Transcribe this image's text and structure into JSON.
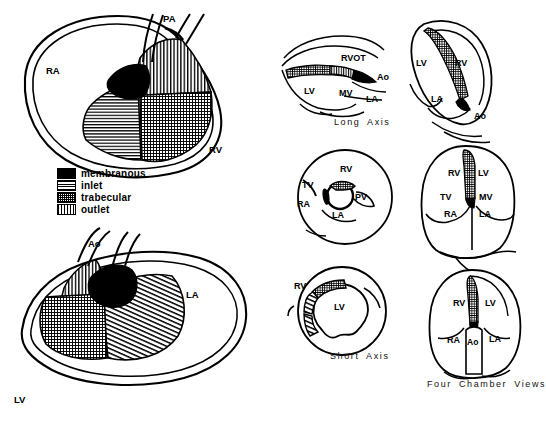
{
  "figure": {
    "stroke_color": "#000000",
    "background_color": "#ffffff"
  },
  "legend": {
    "items": [
      {
        "label": "membranous",
        "pattern": "solid-black",
        "swatch_class": "sw-mem"
      },
      {
        "label": "inlet",
        "pattern": "horizontal-lines",
        "swatch_class": "sw-inlet"
      },
      {
        "label": "trabecular",
        "pattern": "stipple-grid",
        "swatch_class": "sw-trab"
      },
      {
        "label": "outlet",
        "pattern": "vertical-lines",
        "swatch_class": "sw-outlet"
      }
    ]
  },
  "panels": {
    "right_ventricle_view": {
      "name": "Right ventricular septal surface",
      "labels": [
        {
          "text": "PA",
          "x": 163,
          "y": 18
        },
        {
          "text": "RA",
          "x": 46,
          "y": 70
        },
        {
          "text": "RV",
          "x": 209,
          "y": 149
        }
      ]
    },
    "left_ventricle_view": {
      "name": "Left ventricular septal surface",
      "labels": [
        {
          "text": "Ao",
          "x": 88,
          "y": 243
        },
        {
          "text": "LA",
          "x": 186,
          "y": 294
        },
        {
          "text": "LV",
          "x": 14,
          "y": 399
        }
      ]
    },
    "long_axis": {
      "caption": "Long Axis",
      "caption_x": 334,
      "caption_y": 123,
      "labels": [
        {
          "text": "RVOT",
          "x": 341,
          "y": 57
        },
        {
          "text": "Ao",
          "x": 377,
          "y": 76
        },
        {
          "text": "LV",
          "x": 304,
          "y": 90
        },
        {
          "text": "MV",
          "x": 339,
          "y": 92
        },
        {
          "text": "LA",
          "x": 366,
          "y": 98
        }
      ]
    },
    "short_axis_basal": {
      "caption": "",
      "labels": [
        {
          "text": "RV",
          "x": 340,
          "y": 168
        },
        {
          "text": "TV",
          "x": 304,
          "y": 184
        },
        {
          "text": "RA",
          "x": 299,
          "y": 203
        },
        {
          "text": "PV",
          "x": 355,
          "y": 196
        },
        {
          "text": "LA",
          "x": 333,
          "y": 214
        }
      ]
    },
    "short_axis": {
      "caption": "Short Axis",
      "caption_x": 330,
      "caption_y": 357,
      "labels": [
        {
          "text": "RV",
          "x": 296,
          "y": 285
        },
        {
          "text": "LV",
          "x": 334,
          "y": 306
        }
      ]
    },
    "apical_long_axis": {
      "name": "Apical long axis view",
      "labels": [
        {
          "text": "LV",
          "x": 418,
          "y": 62
        },
        {
          "text": "RV",
          "x": 457,
          "y": 62
        },
        {
          "text": "LA",
          "x": 433,
          "y": 98
        },
        {
          "text": "Ao",
          "x": 476,
          "y": 115
        }
      ]
    },
    "four_chamber_upper": {
      "name": "Four chamber view",
      "labels": [
        {
          "text": "RV",
          "x": 450,
          "y": 172
        },
        {
          "text": "LV",
          "x": 479,
          "y": 172
        },
        {
          "text": "TV",
          "x": 442,
          "y": 196
        },
        {
          "text": "MV",
          "x": 481,
          "y": 196
        },
        {
          "text": "RA",
          "x": 446,
          "y": 212
        },
        {
          "text": "LA",
          "x": 481,
          "y": 212
        }
      ]
    },
    "four_chamber_lower": {
      "caption": "Four Chamber Views",
      "caption_x": 427,
      "caption_y": 385,
      "labels": [
        {
          "text": "RV",
          "x": 456,
          "y": 302
        },
        {
          "text": "LV",
          "x": 487,
          "y": 302
        },
        {
          "text": "RA",
          "x": 452,
          "y": 339
        },
        {
          "text": "Ao",
          "x": 478,
          "y": 341
        },
        {
          "text": "LA",
          "x": 499,
          "y": 338
        }
      ]
    }
  }
}
